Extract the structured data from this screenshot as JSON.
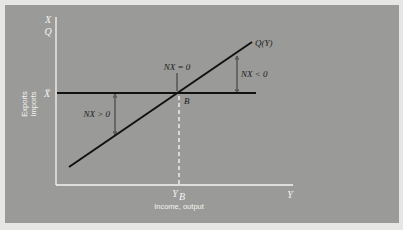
{
  "diagram": {
    "title": "",
    "y_axis": {
      "top_label_1": "X",
      "top_label_2": "Q",
      "side_label_1": "Exports",
      "side_label_2": "Imports",
      "level_label": "X̄"
    },
    "x_axis": {
      "end_label": "Y",
      "tick_label": "Y",
      "tick_subscript": "B",
      "title": "Income, output"
    },
    "curves": {
      "exports_line": "X̄",
      "imports_line": "Q(Y)"
    },
    "annotations": {
      "balance": "NX = 0",
      "deficit": "NX < 0",
      "surplus": "NX > 0",
      "intersection": "B"
    }
  },
  "colors": {
    "background": "#e6e6e4",
    "panel": "#9a9a98",
    "axis": "#f4f4f2",
    "line": "#111111"
  }
}
